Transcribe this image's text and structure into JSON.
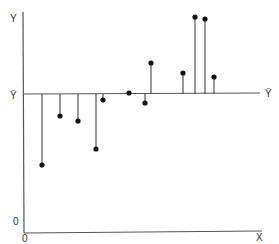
{
  "chart_data": {
    "type": "scatter",
    "title": "",
    "xlabel": "X",
    "ylabel": "Y",
    "mean_line_label": "Ȳ",
    "origin_labels": {
      "y_zero": "0",
      "x_zero": "0"
    },
    "grid": false,
    "mean_y": 0,
    "points": [
      {
        "x": 1,
        "deviation": -72
      },
      {
        "x": 2,
        "deviation": -22
      },
      {
        "x": 3,
        "deviation": -27
      },
      {
        "x": 4,
        "deviation": -55
      },
      {
        "x": 5,
        "deviation": -6
      },
      {
        "x": 6,
        "deviation": 1
      },
      {
        "x": 7,
        "deviation": -9
      },
      {
        "x": 8,
        "deviation": 31
      },
      {
        "x": 9,
        "deviation": 21
      },
      {
        "x": 10,
        "deviation": 77
      },
      {
        "x": 11,
        "deviation": 75
      },
      {
        "x": 12,
        "deviation": 17
      }
    ]
  },
  "labels": {
    "y_axis": "Y",
    "x_axis": "X",
    "mean_left": "Ȳ",
    "mean_right": "Ȳ",
    "y_origin": "0",
    "x_origin": "0"
  },
  "colors": {
    "axis": "#555555",
    "point": "#111111",
    "line": "#444444"
  },
  "plot_px": {
    "mean_line_y": 94,
    "point_px": [
      [
        42,
        165
      ],
      [
        60,
        116
      ],
      [
        78,
        121
      ],
      [
        96,
        149
      ],
      [
        103,
        100
      ],
      [
        129,
        93
      ],
      [
        145,
        103
      ],
      [
        151,
        63
      ],
      [
        183,
        73
      ],
      [
        195,
        17
      ],
      [
        205,
        19
      ],
      [
        214,
        77
      ]
    ]
  }
}
